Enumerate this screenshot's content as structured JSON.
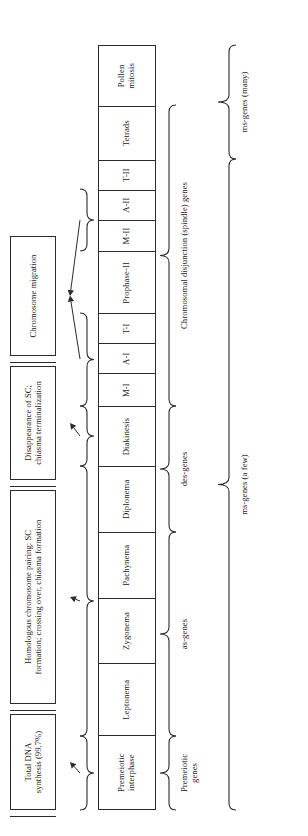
{
  "figure": {
    "orientation": "rotated-90-ccw",
    "ink_color": "#2b2b2b",
    "background": "#ffffff"
  },
  "phases": {
    "items": [
      {
        "id": "premeiotic-interphase",
        "label": "Premeiotic\ninterphase",
        "width": 74
      },
      {
        "id": "leptonema",
        "label": "Leptonema",
        "width": 72
      },
      {
        "id": "zygonema",
        "label": "Zygonema",
        "width": 66
      },
      {
        "id": "pachynema",
        "label": "Pachynema",
        "width": 66
      },
      {
        "id": "diplonema",
        "label": "Diplonema",
        "width": 66
      },
      {
        "id": "diakinesis",
        "label": "Diakinesis",
        "width": 60
      },
      {
        "id": "metaphase-i",
        "label": "M-I",
        "width": 33
      },
      {
        "id": "anaphase-i",
        "label": "A-I",
        "width": 30
      },
      {
        "id": "telophase-i",
        "label": "T-I",
        "width": 30
      },
      {
        "id": "prophase-ii",
        "label": "Prophase-II",
        "width": 62
      },
      {
        "id": "metaphase-ii",
        "label": "M-II",
        "width": 32
      },
      {
        "id": "anaphase-ii",
        "label": "A-II",
        "width": 30
      },
      {
        "id": "telophase-ii",
        "label": "T-II",
        "width": 30
      },
      {
        "id": "tetrads",
        "label": "Tetrads",
        "width": 54
      },
      {
        "id": "pollen-mitosis",
        "label": "Pollen\nmitosis",
        "width": 60
      }
    ]
  },
  "event_captions": {
    "items": [
      {
        "id": "total-dna-synthesis",
        "label": "Total DNA\nsynthesis (99.7%)"
      },
      {
        "id": "homologous-pairing",
        "label": "Homologous chromosome pairing: SC\nformation; crossing over, chiasma formation"
      },
      {
        "id": "sc-disappearance",
        "label": "Disappearance of SC;\nchiasma terminalization"
      },
      {
        "id": "chromosome-migration",
        "label": "Chromosome migration"
      }
    ]
  },
  "gene_groups": {
    "items": [
      {
        "id": "premeiotic-genes",
        "label": "Premeiotic\ngenes"
      },
      {
        "id": "as-genes",
        "label": "as-genes"
      },
      {
        "id": "des-genes",
        "label": "des-genes"
      },
      {
        "id": "spindle-genes",
        "label": "Chromosomal disjunction (spindle) genes"
      }
    ]
  },
  "ms_gene_groups": {
    "items": [
      {
        "id": "ms-genes-a-few",
        "label": "ms-genes (a few)"
      },
      {
        "id": "ms-genes-many",
        "label": "ms-genes (many)"
      }
    ]
  }
}
